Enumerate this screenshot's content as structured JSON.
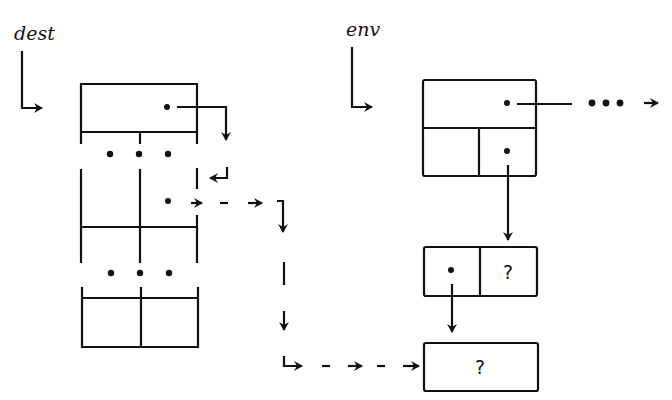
{
  "diagram": {
    "labels": {
      "dest": "dest",
      "env": "env"
    },
    "values": {
      "env_pair_cdr": "?",
      "env_value_cell": "?"
    },
    "ellipsis": {
      "dest_vertical_1": "• • •",
      "dest_vertical_2": "• • •",
      "env_horizontal": "• • •"
    },
    "nodes": [
      {
        "id": "dest-record",
        "description": "tall multi-cell structure pointed to by dest"
      },
      {
        "id": "env-frame",
        "description": "frame box with top slot and two lower cells"
      },
      {
        "id": "env-pair",
        "description": "two-cell pair (pointer, ?)"
      },
      {
        "id": "value-cell",
        "description": "single cell containing ?"
      }
    ],
    "edges": [
      {
        "from": "dest",
        "to": "dest-record",
        "style": "solid"
      },
      {
        "from": "env",
        "to": "env-frame",
        "style": "solid"
      },
      {
        "from": "dest-record.top",
        "to": "dest-record.next",
        "style": "solid"
      },
      {
        "from": "dest-record.slot",
        "to": "value-cell",
        "style": "dashed"
      },
      {
        "from": "env-frame.top",
        "to": "continuation",
        "style": "solid-then-dotted"
      },
      {
        "from": "env-frame.cell2",
        "to": "env-pair",
        "style": "solid"
      },
      {
        "from": "env-pair.car",
        "to": "value-cell",
        "style": "solid"
      }
    ]
  }
}
